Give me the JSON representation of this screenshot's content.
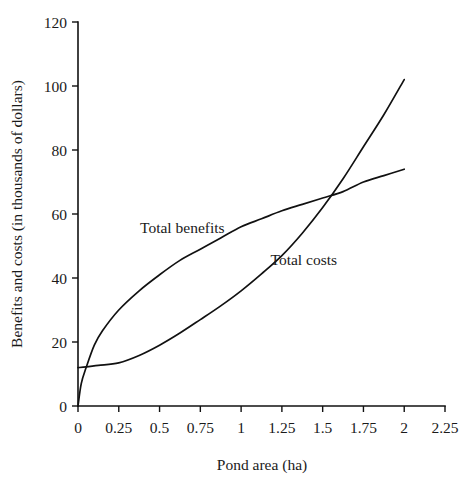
{
  "chart_data": {
    "type": "line",
    "title": "",
    "xlabel": "Pond area (ha)",
    "ylabel": "Benefits and costs (in thousands of dollars)",
    "xlim": [
      0,
      2.25
    ],
    "ylim": [
      0,
      120
    ],
    "grid": false,
    "legend_position": "inline-annotations",
    "x_ticks": [
      "0",
      "0.25",
      "0.5",
      "0.75",
      "1",
      "1.25",
      "1.5",
      "1.75",
      "2",
      "2.25"
    ],
    "x_tick_values": [
      0,
      0.25,
      0.5,
      0.75,
      1,
      1.25,
      1.5,
      1.75,
      2,
      2.25
    ],
    "y_ticks": [
      "0",
      "20",
      "40",
      "60",
      "80",
      "100",
      "120"
    ],
    "y_tick_values": [
      0,
      20,
      40,
      60,
      80,
      100,
      120
    ],
    "series": [
      {
        "name": "Total benefits",
        "label_x": 0.38,
        "label_y": 54,
        "color": "#111111",
        "x": [
          0,
          0.02,
          0.05,
          0.1,
          0.15,
          0.25,
          0.375,
          0.5,
          0.625,
          0.75,
          0.875,
          1.0,
          1.125,
          1.25,
          1.375,
          1.5,
          1.625,
          1.75,
          1.875,
          2.0
        ],
        "values": [
          0,
          7,
          12,
          19,
          23.5,
          30,
          36,
          41,
          45.5,
          49,
          52.5,
          56,
          58.5,
          61,
          63,
          65,
          67,
          70,
          72,
          74
        ]
      },
      {
        "name": "Total costs",
        "label_x": 1.18,
        "label_y": 44,
        "color": "#111111",
        "x": [
          0,
          0.05,
          0.125,
          0.25,
          0.375,
          0.5,
          0.625,
          0.75,
          0.875,
          1.0,
          1.125,
          1.25,
          1.375,
          1.5,
          1.625,
          1.75,
          1.875,
          2.0
        ],
        "values": [
          12,
          12.2,
          12.7,
          13.5,
          15.8,
          19,
          22.8,
          27,
          31.3,
          36,
          41.3,
          47,
          54,
          62,
          71,
          81,
          91,
          102
        ]
      }
    ],
    "annotations": [
      {
        "text": "Total benefits",
        "x": 0.38,
        "y": 54
      },
      {
        "text": "Total costs",
        "x": 1.18,
        "y": 44
      }
    ]
  }
}
